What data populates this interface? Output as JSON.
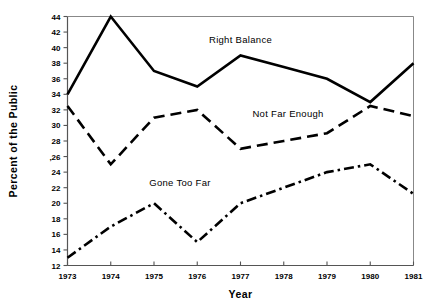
{
  "chart_data": {
    "type": "line",
    "title": "",
    "xlabel": "Year",
    "ylabel": "Percent of the Public",
    "x": [
      1973,
      1974,
      1975,
      1976,
      1977,
      1978,
      1979,
      1980,
      1981
    ],
    "xtick_labels": [
      "1973",
      "1974",
      "1975",
      "1976",
      "1977",
      "1978",
      "1979",
      "1980",
      "1981"
    ],
    "ytick_labels": [
      "12",
      "14",
      "16",
      "18",
      "20",
      "22",
      "24",
      ",26",
      "28",
      "30",
      "32",
      "34",
      "36",
      "38",
      "40",
      "42",
      "44"
    ],
    "ytick_values": [
      12,
      14,
      16,
      18,
      20,
      22,
      24,
      26,
      28,
      30,
      32,
      34,
      36,
      38,
      40,
      42,
      44
    ],
    "xlim": [
      1973,
      1981
    ],
    "ylim": [
      12,
      44
    ],
    "grid": false,
    "legend": "inline-annotations",
    "series": [
      {
        "name": "Right Balance",
        "style": "solid",
        "color": "#000000",
        "values": [
          34,
          44,
          37,
          35,
          39,
          37.5,
          36,
          33,
          38
        ],
        "label_x": 1977.0,
        "label_y": 40.6
      },
      {
        "name": "Not Far Enough",
        "style": "dashed",
        "color": "#000000",
        "values": [
          32.5,
          25,
          31,
          32,
          27,
          28,
          29,
          32.5,
          31.2
        ],
        "label_x": 1978.1,
        "label_y": 31.1
      },
      {
        "name": "Gone Too Far",
        "style": "dashdot",
        "color": "#000000",
        "values": [
          13,
          17,
          20,
          15,
          20,
          22,
          24,
          25,
          21.2
        ],
        "label_x": 1975.6,
        "label_y": 22.2
      }
    ]
  }
}
